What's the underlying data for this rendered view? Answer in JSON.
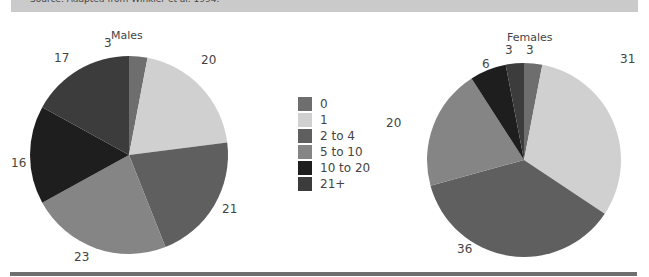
{
  "source_note": "Source: Adapted from Winkler et al. 1994.",
  "legend": {
    "items": [
      {
        "label": "0",
        "color": "#6e6e6e"
      },
      {
        "label": "1",
        "color": "#d0d0d0"
      },
      {
        "label": "2 to 4",
        "color": "#5f5f5f"
      },
      {
        "label": "5 to 10",
        "color": "#858585"
      },
      {
        "label": "10 to 20",
        "color": "#1e1e1e"
      },
      {
        "label": "21+",
        "color": "#3c3c3c"
      }
    ]
  },
  "chart_data": [
    {
      "type": "pie",
      "title": "Males",
      "categories": [
        "0",
        "1",
        "2 to 4",
        "5 to 10",
        "10 to 20",
        "21+"
      ],
      "values": [
        3,
        20,
        21,
        23,
        16,
        17
      ],
      "colors": [
        "#6e6e6e",
        "#d0d0d0",
        "#5f5f5f",
        "#858585",
        "#1e1e1e",
        "#3c3c3c"
      ],
      "legend_position": "center-between-pies"
    },
    {
      "type": "pie",
      "title": "Females",
      "categories": [
        "0",
        "1",
        "2 to 4",
        "5 to 10",
        "10 to 20",
        "21+"
      ],
      "values": [
        3,
        31,
        36,
        20,
        6,
        3
      ],
      "colors": [
        "#6e6e6e",
        "#d0d0d0",
        "#5f5f5f",
        "#858585",
        "#1e1e1e",
        "#3c3c3c"
      ],
      "legend_position": "center-between-pies"
    }
  ]
}
